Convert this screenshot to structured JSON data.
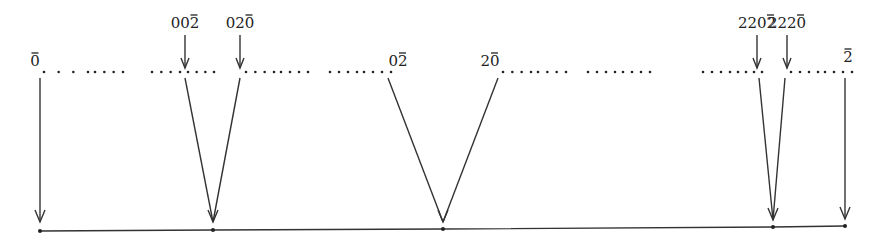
{
  "diagram": {
    "type": "tree-projection",
    "colors": {
      "stroke": "#333333",
      "text": "#222222",
      "background": "#ffffff"
    },
    "top_labels": [
      {
        "id": "bar0",
        "text": "0",
        "overline_from": 0,
        "x": 35,
        "y": 66
      },
      {
        "id": "002bar",
        "text": "002",
        "overline_from": 2,
        "x": 185,
        "y": 28,
        "pointer": true
      },
      {
        "id": "020bar",
        "text": "020",
        "overline_from": 2,
        "x": 240,
        "y": 28,
        "pointer": true
      },
      {
        "id": "02bar",
        "text": "02",
        "overline_from": 1,
        "x": 398,
        "y": 66
      },
      {
        "id": "20bar",
        "text": "20",
        "overline_from": 1,
        "x": 490,
        "y": 66
      },
      {
        "id": "2202bar",
        "text": "2202",
        "overline_from": 3,
        "x": 757,
        "y": 28,
        "pointer": true
      },
      {
        "id": "2220bar",
        "text": "2220",
        "overline_from": 3,
        "x": 787,
        "y": 28,
        "pointer": true
      },
      {
        "id": "bar2",
        "text": "2",
        "overline_from": 0,
        "x": 848,
        "y": 62
      }
    ],
    "dotted_segments": [
      [
        44,
        88
      ],
      [
        95,
        123
      ],
      [
        152,
        180
      ],
      [
        188,
        214
      ],
      [
        246,
        274
      ],
      [
        281,
        308
      ],
      [
        330,
        357
      ],
      [
        364,
        391
      ],
      [
        503,
        531
      ],
      [
        538,
        566
      ],
      [
        588,
        615
      ],
      [
        623,
        650
      ],
      [
        703,
        730
      ],
      [
        738,
        762
      ],
      [
        791,
        818
      ],
      [
        825,
        852
      ]
    ],
    "lines": [
      {
        "from": [
          40,
          78
        ],
        "to": [
          40,
          222
        ],
        "arrow": true
      },
      {
        "from": [
          185,
          78
        ],
        "to": [
          213,
          222
        ],
        "arrow": true
      },
      {
        "from": [
          240,
          78
        ],
        "to": [
          213,
          222
        ],
        "arrow": false
      },
      {
        "from": [
          388,
          78
        ],
        "to": [
          443,
          222
        ],
        "arrow": true
      },
      {
        "from": [
          498,
          78
        ],
        "to": [
          443,
          222
        ],
        "arrow": false
      },
      {
        "from": [
          759,
          78
        ],
        "to": [
          773,
          220
        ],
        "arrow": true
      },
      {
        "from": [
          785,
          78
        ],
        "to": [
          773,
          220
        ],
        "arrow": false
      },
      {
        "from": [
          845,
          78
        ],
        "to": [
          845,
          219
        ],
        "arrow": true
      }
    ],
    "baseline": {
      "points": [
        [
          40,
          231
        ],
        [
          213,
          230
        ],
        [
          443,
          229
        ],
        [
          773,
          227
        ],
        [
          845,
          226
        ]
      ]
    }
  }
}
